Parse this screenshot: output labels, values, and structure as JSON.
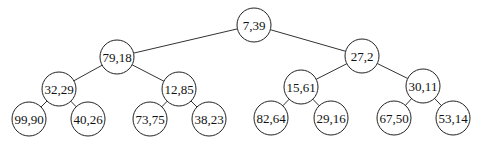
{
  "diagram": {
    "type": "binary-tree",
    "node_radius": 17,
    "nodes": [
      {
        "id": "n0",
        "label": "7,39",
        "cx": 254,
        "cy": 25
      },
      {
        "id": "n1",
        "label": "79,18",
        "cx": 117,
        "cy": 57
      },
      {
        "id": "n2",
        "label": "27,2",
        "cx": 362,
        "cy": 56
      },
      {
        "id": "n3",
        "label": "32,29",
        "cx": 59,
        "cy": 89
      },
      {
        "id": "n4",
        "label": "12,85",
        "cx": 179,
        "cy": 89
      },
      {
        "id": "n5",
        "label": "15,61",
        "cx": 301,
        "cy": 87
      },
      {
        "id": "n6",
        "label": "30,11",
        "cx": 423,
        "cy": 86
      },
      {
        "id": "n7",
        "label": "99,90",
        "cx": 29,
        "cy": 119
      },
      {
        "id": "n8",
        "label": "40,26",
        "cx": 88,
        "cy": 119
      },
      {
        "id": "n9",
        "label": "73,75",
        "cx": 150,
        "cy": 119
      },
      {
        "id": "n10",
        "label": "38,23",
        "cx": 209,
        "cy": 119
      },
      {
        "id": "n11",
        "label": "82,64",
        "cx": 271,
        "cy": 118
      },
      {
        "id": "n12",
        "label": "29,16",
        "cx": 331,
        "cy": 118
      },
      {
        "id": "n13",
        "label": "67,50",
        "cx": 394,
        "cy": 118
      },
      {
        "id": "n14",
        "label": "53,14",
        "cx": 453,
        "cy": 118
      }
    ],
    "edges": [
      [
        "n0",
        "n1"
      ],
      [
        "n0",
        "n2"
      ],
      [
        "n1",
        "n3"
      ],
      [
        "n1",
        "n4"
      ],
      [
        "n2",
        "n5"
      ],
      [
        "n2",
        "n6"
      ],
      [
        "n3",
        "n7"
      ],
      [
        "n3",
        "n8"
      ],
      [
        "n4",
        "n9"
      ],
      [
        "n4",
        "n10"
      ],
      [
        "n5",
        "n11"
      ],
      [
        "n5",
        "n12"
      ],
      [
        "n6",
        "n13"
      ],
      [
        "n6",
        "n14"
      ]
    ]
  }
}
